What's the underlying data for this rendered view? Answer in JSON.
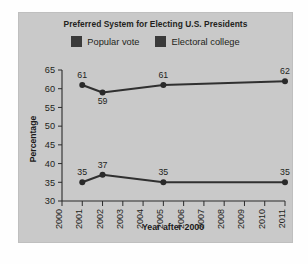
{
  "chart_data": {
    "type": "line",
    "title": "Preferred System for Electing U.S. Presidents",
    "xlabel": "Year after 2000",
    "ylabel": "Percentage",
    "xlim": [
      2000,
      2011
    ],
    "ylim": [
      30,
      65
    ],
    "ytick_labels": [
      "30",
      "35",
      "40",
      "45",
      "50",
      "55",
      "60",
      "65"
    ],
    "yticks": [
      30,
      35,
      40,
      45,
      50,
      55,
      60,
      65
    ],
    "xtick_labels": [
      "2000",
      "2001",
      "2002",
      "2003",
      "2004",
      "2005",
      "2006",
      "2007",
      "2008",
      "2009",
      "2010",
      "2011"
    ],
    "xticks": [
      2000,
      2001,
      2002,
      2003,
      2004,
      2005,
      2006,
      2007,
      2008,
      2009,
      2010,
      2011
    ],
    "grid": false,
    "legend_position": "top-center",
    "series": [
      {
        "name": "Popular vote",
        "color": "#303030",
        "x": [
          2001,
          2002,
          2005,
          2011
        ],
        "values": [
          61,
          59,
          61,
          62
        ],
        "labels": [
          "61",
          "59",
          "61",
          "62"
        ],
        "label_positions": [
          "above",
          "below",
          "above",
          "above"
        ]
      },
      {
        "name": "Electoral college",
        "color": "#303030",
        "x": [
          2001,
          2002,
          2005,
          2011
        ],
        "values": [
          35,
          37,
          35,
          35
        ],
        "labels": [
          "35",
          "37",
          "35",
          "35"
        ],
        "label_positions": [
          "above",
          "above",
          "above",
          "above"
        ]
      }
    ]
  },
  "legend": {
    "items": [
      {
        "label": "Popular vote",
        "swatch_color": "#3a3a3a"
      },
      {
        "label": "Electoral college",
        "swatch_color": "#3a3a3a"
      }
    ]
  },
  "colors": {
    "panel_background": "#c9c9c9",
    "page_background": "#fefefe",
    "axis": "#2b2b2b",
    "text": "#231f20",
    "series": "#303030"
  }
}
